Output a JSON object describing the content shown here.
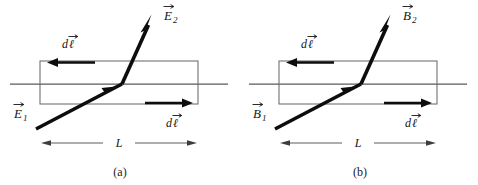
{
  "figure": {
    "width": 478,
    "height": 185,
    "background_color": "#ffffff"
  },
  "colors": {
    "ray": "#0d0d0d",
    "boundary": "#5a5a5a",
    "loop": "#6b6b6b",
    "dimension": "#3d3d3d",
    "text": "#141414"
  },
  "panels": [
    {
      "id": "panel-a",
      "caption": "(a)",
      "caption_x": 120,
      "caption_y": 176,
      "origin_x": 0,
      "field_symbol": "E",
      "incident_label": {
        "symbol": "E",
        "subscript": "1",
        "x": 14,
        "y": 118
      },
      "transmitted_label": {
        "symbol": "E",
        "subscript": "2",
        "x": 164,
        "y": 20
      },
      "dl_top_label": {
        "text": "d",
        "script": "ℓ",
        "x": 62,
        "y": 48
      },
      "dl_bottom_label": {
        "text": "d",
        "script": "ℓ",
        "x": 166,
        "y": 127
      },
      "length_label": {
        "text": "L",
        "x": 119,
        "y": 147
      }
    },
    {
      "id": "panel-b",
      "caption": "(b)",
      "caption_x": 360,
      "caption_y": 176,
      "origin_x": 239,
      "field_symbol": "B",
      "incident_label": {
        "symbol": "B",
        "subscript": "1",
        "x": 253,
        "y": 118
      },
      "transmitted_label": {
        "symbol": "B",
        "subscript": "2",
        "x": 403,
        "y": 20
      },
      "dl_top_label": {
        "text": "d",
        "script": "ℓ",
        "x": 301,
        "y": 48
      },
      "dl_bottom_label": {
        "text": "d",
        "script": "ℓ",
        "x": 405,
        "y": 127
      },
      "length_label": {
        "text": "L",
        "x": 358,
        "y": 147
      }
    }
  ],
  "geometry": {
    "boundary": {
      "x1": 10,
      "x2": 228,
      "y": 84
    },
    "loop_rect": {
      "x": 40,
      "y": 61,
      "width": 158,
      "height": 43
    },
    "ray_lower": {
      "x1": 36,
      "y1": 129,
      "x2": 122,
      "y2": 84
    },
    "ray_upper": {
      "x1": 122,
      "y1": 84,
      "x2": 150,
      "y2": 22
    },
    "ray_mid_arrow": {
      "x": 110,
      "y": 90.5
    },
    "dl_top_arrow": {
      "x_start": 95,
      "x_end": 48,
      "y": 62.5
    },
    "dl_bottom_arrow": {
      "x_start": 145,
      "x_end": 192,
      "y": 103
    },
    "dim_line": {
      "x1": 42,
      "x2": 196,
      "y": 143
    }
  }
}
